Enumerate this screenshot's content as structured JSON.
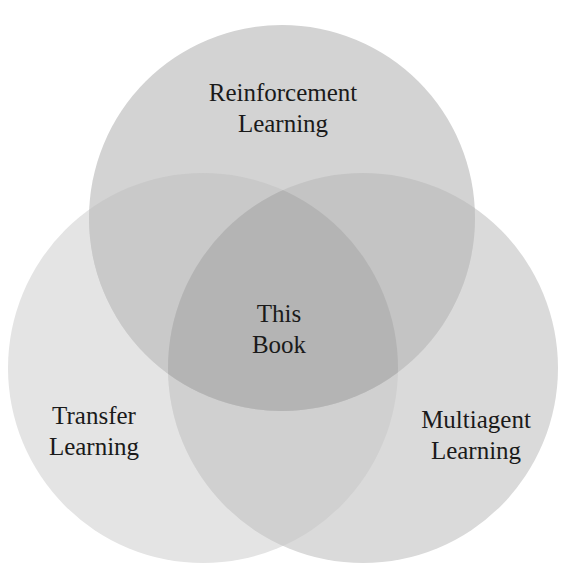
{
  "diagram": {
    "type": "venn",
    "sets": [
      {
        "id": "top",
        "label_lines": [
          "Reinforcement",
          "Learning"
        ],
        "cx": 282,
        "cy": 218,
        "r": 193,
        "fill": "#d3d3d3"
      },
      {
        "id": "left",
        "label_lines": [
          "Transfer",
          "Learning"
        ],
        "cx": 203,
        "cy": 368,
        "r": 195,
        "fill": "#e4e4e4"
      },
      {
        "id": "right",
        "label_lines": [
          "Multiagent",
          "Learning"
        ],
        "cx": 363,
        "cy": 368,
        "r": 195,
        "fill": "#dadada"
      }
    ],
    "intersection": {
      "id": "center",
      "label_lines": [
        "This",
        "Book"
      ]
    },
    "colors": {
      "background": "#ffffff",
      "pair_overlap": "#c4c4c4",
      "triple_overlap": "#b4b4b4",
      "text": "#1a1a1a"
    }
  }
}
